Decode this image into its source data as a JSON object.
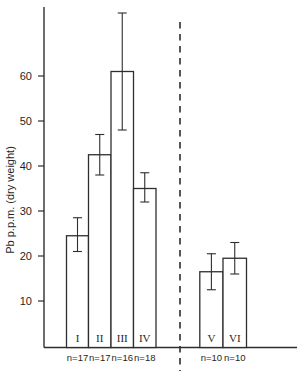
{
  "figure": {
    "background": "#ffffff",
    "line_color": "#2e2e2e",
    "text_color": "#1f1f1f"
  },
  "chart_data": {
    "type": "bar",
    "title": "",
    "xlabel": "",
    "ylabel": "Pb p.p.m. (dry weight)",
    "ylim": [
      0,
      75
    ],
    "yticks": [
      10,
      20,
      30,
      40,
      50,
      60
    ],
    "grid": false,
    "legend": "none",
    "bar_fill": "#ffffff",
    "divider": {
      "style": "dashed-vertical-line",
      "between": [
        "IV",
        "V"
      ]
    },
    "groups": [
      {
        "label": "I",
        "n_label": "n=17",
        "value": 24.5,
        "err_low": 21.0,
        "err_high": 28.5,
        "panel": "left"
      },
      {
        "label": "II",
        "n_label": "n=17",
        "value": 42.5,
        "err_low": 38.0,
        "err_high": 47.0,
        "panel": "left"
      },
      {
        "label": "III",
        "n_label": "n=16",
        "value": 61.0,
        "err_low": 48.0,
        "err_high": 74.0,
        "panel": "left"
      },
      {
        "label": "IV",
        "n_label": "n=18",
        "value": 35.0,
        "err_low": 32.0,
        "err_high": 38.5,
        "panel": "left"
      },
      {
        "label": "V",
        "n_label": "n=10",
        "value": 16.5,
        "err_low": 12.5,
        "err_high": 20.5,
        "panel": "right"
      },
      {
        "label": "VI",
        "n_label": "n=10",
        "value": 19.5,
        "err_low": 16.0,
        "err_high": 23.0,
        "panel": "right"
      }
    ]
  }
}
